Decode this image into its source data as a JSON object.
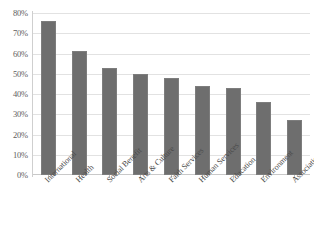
{
  "chart_data": {
    "type": "bar",
    "title": "",
    "subtitle": "",
    "xlabel": "",
    "ylabel": "",
    "categories": [
      "International",
      "Health",
      "Social Benefit",
      "Arts & Culture",
      "Faith Services",
      "Human Services",
      "Education",
      "Environment",
      "Associations"
    ],
    "values": [
      76,
      61,
      53,
      50,
      48,
      44,
      43,
      36,
      27
    ],
    "value_labels": [
      "76%",
      "61%",
      "53%",
      "50%",
      "48%",
      "44%",
      "43%",
      "36%",
      "27%"
    ],
    "ylim": [
      0,
      80
    ],
    "ytick_values": [
      0,
      10,
      20,
      30,
      40,
      50,
      60,
      70,
      80
    ],
    "ytick_labels": [
      "0%",
      "10%",
      "20%",
      "30%",
      "40%",
      "50%",
      "60%",
      "70%",
      "80%"
    ],
    "grid": true,
    "legend": null,
    "legend_position": "none",
    "series_name": "",
    "bar_color": "#6e6e6e",
    "gridline_color": "#e2e2e2",
    "axis_color": "#cfcfcf",
    "tick_label_color": "#5d5d5d",
    "category_label_color": "#4a4a4a",
    "background_color": "#ffffff",
    "category_label_rotation": -45
  }
}
